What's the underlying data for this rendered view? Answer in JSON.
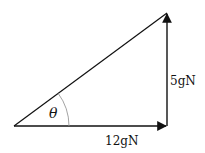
{
  "diagram": {
    "type": "force-triangle",
    "vertices": {
      "origin": [
        14,
        126
      ],
      "right_angle": [
        167,
        126
      ],
      "top": [
        167,
        13
      ]
    },
    "angle_label": "θ",
    "horizontal_label": "12gN",
    "vertical_label": "5gN",
    "colors": {
      "line": "#111111",
      "arc": "#999999",
      "background": "#ffffff"
    }
  }
}
